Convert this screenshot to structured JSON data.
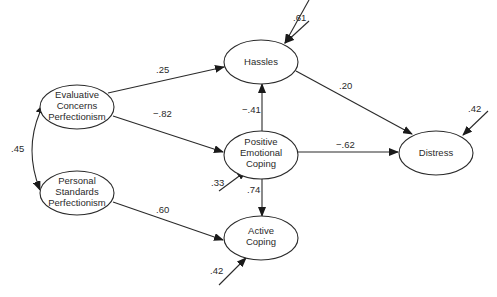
{
  "diagram": {
    "type": "path-model",
    "nodes": {
      "ecp": {
        "lines": [
          "Evaluative",
          "Concerns",
          "Perfectionism"
        ]
      },
      "psp": {
        "lines": [
          "Personal",
          "Standards",
          "Perfectionism"
        ]
      },
      "hassles": {
        "lines": [
          "Hassles"
        ]
      },
      "pec": {
        "lines": [
          "Positive",
          "Emotional",
          "Coping"
        ]
      },
      "active": {
        "lines": [
          "Active",
          "Coping"
        ]
      },
      "distress": {
        "lines": [
          "Distress"
        ]
      }
    },
    "edges": [
      {
        "from": "Evaluative Concerns Perfectionism",
        "to": "Hassles",
        "label": ".25"
      },
      {
        "from": "Evaluative Concerns Perfectionism",
        "to": "Positive Emotional Coping",
        "label": "−.82"
      },
      {
        "from": "Personal Standards Perfectionism",
        "to": "Active Coping",
        "label": ".60"
      },
      {
        "from": "Positive Emotional Coping",
        "to": "Hassles",
        "label": "−.41"
      },
      {
        "from": "Positive Emotional Coping",
        "to": "Active Coping",
        "label": ".74"
      },
      {
        "from": "Positive Emotional Coping",
        "to": "Distress",
        "label": "−.62"
      },
      {
        "from": "Hassles",
        "to": "Distress",
        "label": ".20"
      }
    ],
    "correlation": {
      "between": [
        "Evaluative Concerns Perfectionism",
        "Personal Standards Perfectionism"
      ],
      "label": ".45"
    },
    "residuals": {
      "hassles": ".61",
      "pec": ".33",
      "active": ".42",
      "distress": ".42"
    }
  }
}
